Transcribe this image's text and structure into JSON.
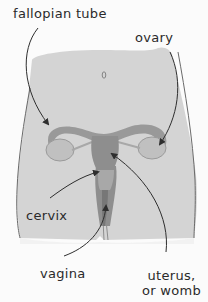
{
  "diagram": {
    "navel_mark": "0",
    "labels": [
      {
        "id": "fallopian-tube",
        "text": "fallopian tube"
      },
      {
        "id": "ovary",
        "text": "ovary"
      },
      {
        "id": "cervix",
        "text": "cervix"
      },
      {
        "id": "vagina",
        "text": "vagina"
      },
      {
        "id": "uterus",
        "text": "uterus,\nor womb"
      }
    ],
    "colors": {
      "background": "#fbfbfb",
      "body_fill": "#d4d4d4",
      "body_outline": "#6a6a6a",
      "organ_dark": "#8e8e8e",
      "organ_mid": "#a8a8a8",
      "ovary_fill": "#c0c0c0",
      "arrow": "#2e2e2e",
      "text": "#2a2a2a"
    }
  }
}
